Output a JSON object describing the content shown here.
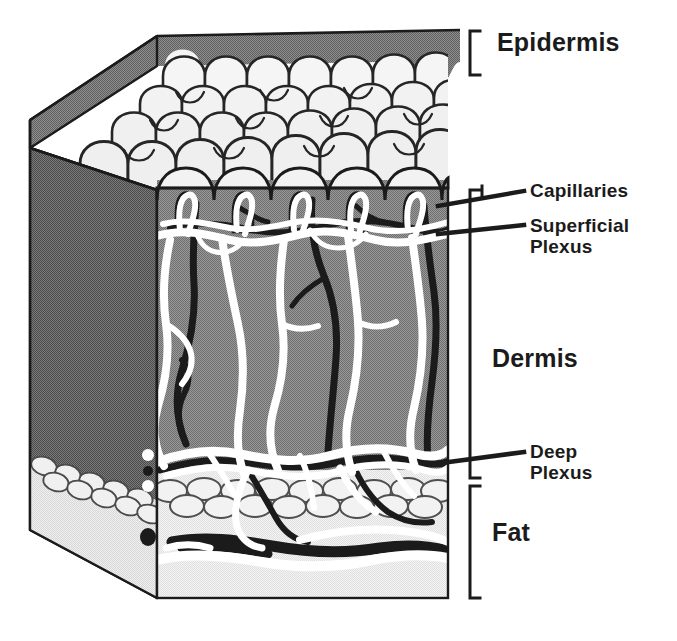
{
  "figure": {
    "type": "anatomical-cutaway-diagram",
    "colors": {
      "background": "#ffffff",
      "outline": "#1b1b1b",
      "epidermis_top_fill": "#808080",
      "epidermis_cell_fill": "#f2f2f2",
      "dermis_fill": "#8c8c8c",
      "dermis_side_fill": "#6e6e6e",
      "fat_fill": "#ededed",
      "fat_side_fill": "#e2e2e2",
      "vein_white": "#ffffff",
      "artery_dark": "#1b1b1b",
      "text": "#1b1b1b"
    }
  },
  "labels": {
    "epidermis": "Epidermis",
    "dermis": "Dermis",
    "fat": "Fat",
    "capillaries": "Capillaries",
    "superficial_plexus_line1": "Superficial",
    "superficial_plexus_line2": "Plexus",
    "deep_plexus_line1": "Deep",
    "deep_plexus_line2": "Plexus"
  },
  "brackets": [
    {
      "name": "epidermis",
      "top": 30,
      "bottom": 76,
      "x": 470
    },
    {
      "name": "dermis",
      "top": 190,
      "bottom": 478,
      "x": 470
    },
    {
      "name": "fat",
      "top": 484,
      "bottom": 598,
      "x": 470
    }
  ],
  "leader_lines": [
    {
      "name": "capillaries",
      "from_x": 440,
      "from_y": 205,
      "to_x": 524,
      "to_y": 191
    },
    {
      "name": "superficial-plexus",
      "from_x": 440,
      "from_y": 232,
      "to_x": 524,
      "to_y": 224
    },
    {
      "name": "deep-plexus",
      "from_x": 436,
      "from_y": 462,
      "to_x": 524,
      "to_y": 452
    }
  ],
  "layers": [
    {
      "name": "Epidermis",
      "order": 1,
      "description": "Scalloped keratinocyte surface with rete ridges"
    },
    {
      "name": "Dermis",
      "order": 2,
      "description": "Gray connective tissue containing superficial and deep vascular plexus"
    },
    {
      "name": "Fat",
      "order": 3,
      "description": "Subcutaneous adipose tissue with lobular fat cells"
    }
  ],
  "vascular_features": [
    {
      "name": "Capillaries",
      "depth": "dermal papillae",
      "rendering": "white hairpin loops"
    },
    {
      "name": "Superficial Plexus",
      "depth": "upper dermis",
      "rendering": "horizontal white anastomosing network"
    },
    {
      "name": "Deep Plexus",
      "depth": "dermal-subcutaneous junction",
      "rendering": "horizontal white and dark network"
    }
  ]
}
